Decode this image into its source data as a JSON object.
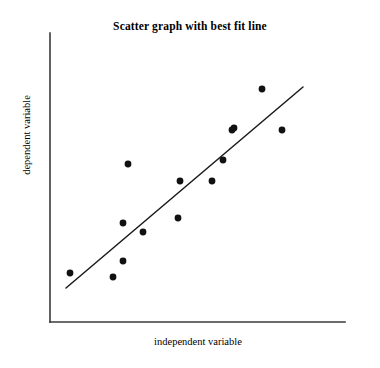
{
  "chart_data": {
    "type": "scatter",
    "title": "Scatter graph with best fit line",
    "xlabel": "independent variable",
    "ylabel": "dependent variable",
    "grid": false,
    "legend": null,
    "axis_ticks": {
      "x": [],
      "y": []
    },
    "axes": {
      "x_axis_line": {
        "x1": 50,
        "y1": 322,
        "x2": 345,
        "y2": 322
      },
      "y_axis_line": {
        "x1": 50,
        "y1": 33,
        "x2": 50,
        "y2": 322
      },
      "origin_px": [
        50,
        322
      ],
      "x_range_px": [
        50,
        345
      ],
      "y_range_px": [
        33,
        322
      ]
    },
    "points_px": [
      {
        "x": 70,
        "y": 273
      },
      {
        "x": 113,
        "y": 277
      },
      {
        "x": 123,
        "y": 261
      },
      {
        "x": 123,
        "y": 223
      },
      {
        "x": 143,
        "y": 232
      },
      {
        "x": 128,
        "y": 164
      },
      {
        "x": 178,
        "y": 218
      },
      {
        "x": 180,
        "y": 181
      },
      {
        "x": 212,
        "y": 181
      },
      {
        "x": 223,
        "y": 160
      },
      {
        "x": 234,
        "y": 128
      },
      {
        "x": 262,
        "y": 89
      },
      {
        "x": 282,
        "y": 130
      },
      {
        "x": 232,
        "y": 130
      }
    ],
    "points_data": [
      {
        "x": 0.07,
        "y": 0.17
      },
      {
        "x": 0.21,
        "y": 0.16
      },
      {
        "x": 0.25,
        "y": 0.21
      },
      {
        "x": 0.25,
        "y": 0.34
      },
      {
        "x": 0.32,
        "y": 0.31
      },
      {
        "x": 0.26,
        "y": 0.55
      },
      {
        "x": 0.43,
        "y": 0.36
      },
      {
        "x": 0.44,
        "y": 0.49
      },
      {
        "x": 0.55,
        "y": 0.49
      },
      {
        "x": 0.59,
        "y": 0.56
      },
      {
        "x": 0.62,
        "y": 0.67
      },
      {
        "x": 0.72,
        "y": 0.81
      },
      {
        "x": 0.79,
        "y": 0.66
      },
      {
        "x": 0.62,
        "y": 0.66
      }
    ],
    "best_fit_line": {
      "label": "best fit line",
      "x1_px": 66,
      "y1_px": 288,
      "x2_px": 303,
      "y2_px": 87,
      "slope_px": -0.848,
      "style": "solid"
    },
    "marker": {
      "shape": "circle",
      "radius_px": 3.4,
      "color": "#111111"
    },
    "colors": {
      "background": "#ffffff",
      "axis": "#3a3a3a",
      "line": "#1a1a1a",
      "marker": "#111111",
      "text": "#000000"
    }
  }
}
